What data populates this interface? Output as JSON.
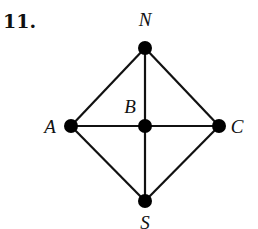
{
  "problem": {
    "number": "11."
  },
  "graph": {
    "nodes": [
      {
        "id": "N",
        "label": "N",
        "x": 145,
        "y": 48,
        "lx": 145,
        "ly": 26
      },
      {
        "id": "A",
        "label": "A",
        "x": 71,
        "y": 126,
        "lx": 50,
        "ly": 133
      },
      {
        "id": "B",
        "label": "B",
        "x": 145,
        "y": 126,
        "lx": 130,
        "ly": 113
      },
      {
        "id": "C",
        "label": "C",
        "x": 219,
        "y": 126,
        "lx": 237,
        "ly": 133
      },
      {
        "id": "S",
        "label": "S",
        "x": 145,
        "y": 201,
        "lx": 145,
        "ly": 229
      }
    ],
    "edges": [
      [
        "N",
        "A"
      ],
      [
        "N",
        "B"
      ],
      [
        "N",
        "C"
      ],
      [
        "A",
        "B"
      ],
      [
        "B",
        "C"
      ],
      [
        "A",
        "S"
      ],
      [
        "B",
        "S"
      ],
      [
        "C",
        "S"
      ]
    ],
    "edge_color": "#111111",
    "node_color": "#000000"
  }
}
